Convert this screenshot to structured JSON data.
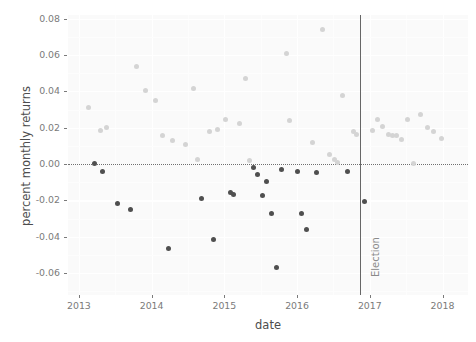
{
  "chart_data": {
    "type": "scatter",
    "title": "",
    "xlabel": "date",
    "ylabel": "percent monthly returns",
    "xlim": [
      2012.85,
      2018.35
    ],
    "ylim": [
      -0.072,
      0.082
    ],
    "grid": true,
    "legend": null,
    "x_ticks": [
      {
        "value": 2013,
        "label": "2013"
      },
      {
        "value": 2014,
        "label": "2014"
      },
      {
        "value": 2015,
        "label": "2015"
      },
      {
        "value": 2016,
        "label": "2016"
      },
      {
        "value": 2017,
        "label": "2017"
      },
      {
        "value": 2018,
        "label": "2018"
      }
    ],
    "y_ticks": [
      {
        "value": 0.08,
        "label": "0.08"
      },
      {
        "value": 0.06,
        "label": "0.06"
      },
      {
        "value": 0.04,
        "label": "0.04"
      },
      {
        "value": 0.02,
        "label": "0.02"
      },
      {
        "value": 0.0,
        "label": "0.00"
      },
      {
        "value": -0.02,
        "label": "-0.02"
      },
      {
        "value": -0.04,
        "label": "-0.04"
      },
      {
        "value": -0.06,
        "label": "-0.06"
      }
    ],
    "reference_lines": [
      {
        "name": "zero-line",
        "orientation": "horizontal",
        "value": 0.0,
        "style": "dotted",
        "color": "#6f6f6f"
      },
      {
        "name": "election-line",
        "orientation": "vertical",
        "value": 2016.86,
        "label": "Election",
        "style": "solid",
        "color": "#666666"
      }
    ],
    "colors": {
      "positive_point": "#d4d4d4",
      "negative_point": "#4f4f4f",
      "panel_background": "#fafafa",
      "grid_major": "#ffffff",
      "axis_text": "#7a7a7a",
      "axis_title": "#4d4d4d"
    },
    "point_count": 62,
    "points": [
      {
        "x": 2013.13,
        "y": 0.0312,
        "sign": "pos"
      },
      {
        "x": 2013.21,
        "y": 0.0004,
        "sign": "neg"
      },
      {
        "x": 2013.29,
        "y": 0.0186,
        "sign": "pos"
      },
      {
        "x": 2013.33,
        "y": -0.0043,
        "sign": "neg"
      },
      {
        "x": 2013.38,
        "y": 0.0203,
        "sign": "pos"
      },
      {
        "x": 2013.53,
        "y": -0.0215,
        "sign": "neg"
      },
      {
        "x": 2013.71,
        "y": -0.0251,
        "sign": "neg"
      },
      {
        "x": 2013.79,
        "y": 0.0537,
        "sign": "pos"
      },
      {
        "x": 2013.92,
        "y": 0.0406,
        "sign": "pos"
      },
      {
        "x": 2014.05,
        "y": 0.0352,
        "sign": "pos"
      },
      {
        "x": 2014.15,
        "y": 0.0157,
        "sign": "pos"
      },
      {
        "x": 2014.23,
        "y": -0.0466,
        "sign": "neg"
      },
      {
        "x": 2014.29,
        "y": 0.0131,
        "sign": "pos"
      },
      {
        "x": 2014.46,
        "y": 0.0106,
        "sign": "pos"
      },
      {
        "x": 2014.58,
        "y": 0.0417,
        "sign": "pos"
      },
      {
        "x": 2014.63,
        "y": 0.0024,
        "sign": "pos"
      },
      {
        "x": 2014.69,
        "y": -0.0191,
        "sign": "neg"
      },
      {
        "x": 2014.79,
        "y": 0.0177,
        "sign": "pos"
      },
      {
        "x": 2014.85,
        "y": -0.0412,
        "sign": "neg"
      },
      {
        "x": 2014.9,
        "y": 0.0192,
        "sign": "pos"
      },
      {
        "x": 2015.02,
        "y": 0.0248,
        "sign": "pos"
      },
      {
        "x": 2015.08,
        "y": -0.0158,
        "sign": "neg"
      },
      {
        "x": 2015.13,
        "y": -0.0168,
        "sign": "neg"
      },
      {
        "x": 2015.21,
        "y": 0.0221,
        "sign": "pos"
      },
      {
        "x": 2015.29,
        "y": 0.0469,
        "sign": "pos"
      },
      {
        "x": 2015.35,
        "y": 0.0019,
        "sign": "pos"
      },
      {
        "x": 2015.4,
        "y": -0.0017,
        "sign": "neg"
      },
      {
        "x": 2015.46,
        "y": -0.0055,
        "sign": "neg"
      },
      {
        "x": 2015.52,
        "y": -0.0172,
        "sign": "neg"
      },
      {
        "x": 2015.58,
        "y": -0.0098,
        "sign": "neg"
      },
      {
        "x": 2015.65,
        "y": -0.0274,
        "sign": "neg"
      },
      {
        "x": 2015.71,
        "y": -0.0568,
        "sign": "neg"
      },
      {
        "x": 2015.79,
        "y": -0.0031,
        "sign": "neg"
      },
      {
        "x": 2015.85,
        "y": 0.0607,
        "sign": "pos"
      },
      {
        "x": 2015.9,
        "y": 0.0239,
        "sign": "pos"
      },
      {
        "x": 2016.0,
        "y": -0.0043,
        "sign": "neg"
      },
      {
        "x": 2016.06,
        "y": -0.0271,
        "sign": "neg"
      },
      {
        "x": 2016.13,
        "y": -0.0358,
        "sign": "neg"
      },
      {
        "x": 2016.21,
        "y": 0.0117,
        "sign": "pos"
      },
      {
        "x": 2016.27,
        "y": -0.0044,
        "sign": "neg"
      },
      {
        "x": 2016.35,
        "y": 0.0742,
        "sign": "pos"
      },
      {
        "x": 2016.44,
        "y": 0.0052,
        "sign": "pos"
      },
      {
        "x": 2016.52,
        "y": 0.0026,
        "sign": "pos"
      },
      {
        "x": 2016.56,
        "y": 0.0009,
        "sign": "pos"
      },
      {
        "x": 2016.63,
        "y": 0.0377,
        "sign": "pos"
      },
      {
        "x": 2016.69,
        "y": -0.0043,
        "sign": "neg"
      },
      {
        "x": 2016.77,
        "y": 0.0181,
        "sign": "pos"
      },
      {
        "x": 2016.81,
        "y": 0.0164,
        "sign": "pos"
      },
      {
        "x": 2016.92,
        "y": -0.0203,
        "sign": "neg"
      },
      {
        "x": 2017.04,
        "y": 0.0183,
        "sign": "pos"
      },
      {
        "x": 2017.1,
        "y": 0.0247,
        "sign": "pos"
      },
      {
        "x": 2017.17,
        "y": 0.0205,
        "sign": "pos"
      },
      {
        "x": 2017.25,
        "y": 0.0163,
        "sign": "pos"
      },
      {
        "x": 2017.31,
        "y": 0.0159,
        "sign": "pos"
      },
      {
        "x": 2017.37,
        "y": 0.0157,
        "sign": "pos"
      },
      {
        "x": 2017.44,
        "y": 0.0134,
        "sign": "pos"
      },
      {
        "x": 2017.52,
        "y": 0.0247,
        "sign": "pos"
      },
      {
        "x": 2017.6,
        "y": 0.0001,
        "sign": "pos"
      },
      {
        "x": 2017.69,
        "y": 0.0271,
        "sign": "pos"
      },
      {
        "x": 2017.79,
        "y": 0.0199,
        "sign": "pos"
      },
      {
        "x": 2017.87,
        "y": 0.0177,
        "sign": "pos"
      },
      {
        "x": 2017.98,
        "y": 0.0141,
        "sign": "pos"
      }
    ]
  }
}
